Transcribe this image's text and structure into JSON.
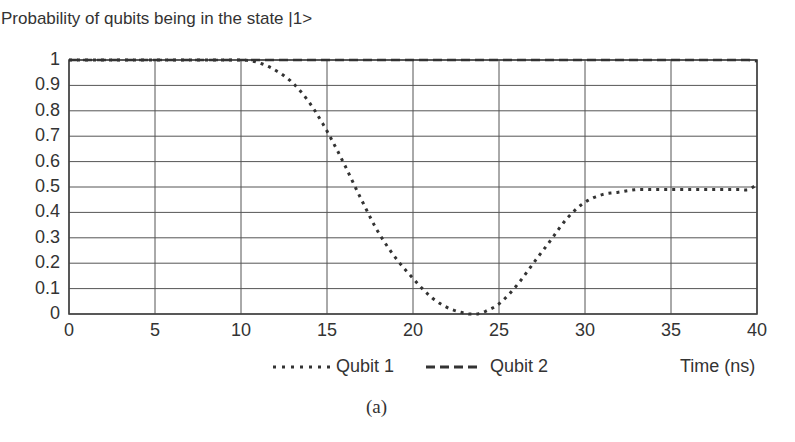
{
  "chart_data": {
    "type": "line",
    "title": "Probability of qubits being in the state |1>",
    "xlabel": "Time (ns)",
    "ylabel": "",
    "xlim": [
      0,
      40
    ],
    "ylim": [
      0,
      1
    ],
    "grid": true,
    "legend_position": "bottom",
    "x_ticks": [
      "0",
      "5",
      "10",
      "15",
      "20",
      "25",
      "30",
      "35",
      "40"
    ],
    "y_ticks": [
      "0",
      "0.1",
      "0.2",
      "0.3",
      "0.4",
      "0.5",
      "0.6",
      "0.7",
      "0.8",
      "0.9",
      "1"
    ],
    "x": [
      0,
      2,
      4,
      6,
      8,
      10,
      11,
      12,
      13,
      14,
      15,
      16,
      17,
      18,
      19,
      20,
      21,
      22,
      23,
      23.5,
      24,
      25,
      26,
      27,
      28,
      29,
      30,
      31,
      32,
      33,
      34,
      35,
      36,
      37,
      38,
      39,
      39.5,
      40
    ],
    "series": [
      {
        "name": "Qubit 1",
        "style": "dotted",
        "values": [
          1.0,
          1.0,
          1.0,
          1.0,
          1.0,
          1.0,
          0.99,
          0.96,
          0.91,
          0.83,
          0.72,
          0.59,
          0.45,
          0.32,
          0.22,
          0.14,
          0.07,
          0.025,
          0.003,
          0.0,
          0.005,
          0.04,
          0.11,
          0.2,
          0.29,
          0.38,
          0.44,
          0.47,
          0.48,
          0.49,
          0.49,
          0.49,
          0.49,
          0.49,
          0.49,
          0.49,
          0.49,
          0.51
        ]
      },
      {
        "name": "Qubit 2",
        "style": "dashed",
        "values": [
          1.0,
          1.0,
          1.0,
          1.0,
          1.0,
          1.0,
          1.0,
          1.0,
          1.0,
          1.0,
          1.0,
          1.0,
          1.0,
          1.0,
          1.0,
          1.0,
          1.0,
          1.0,
          1.0,
          1.0,
          1.0,
          1.0,
          1.0,
          1.0,
          1.0,
          1.0,
          1.0,
          1.0,
          1.0,
          1.0,
          1.0,
          1.0,
          1.0,
          1.0,
          1.0,
          1.0,
          1.0,
          0.995
        ]
      }
    ],
    "caption": "(a)"
  },
  "legend": {
    "qubit1": "Qubit 1",
    "qubit2": "Qubit 2"
  },
  "colors": {
    "line": "#333333",
    "grid": "#555555",
    "background": "#ffffff"
  }
}
